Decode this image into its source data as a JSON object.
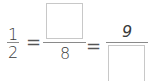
{
  "equation": {
    "fraction_1": {
      "numerator": "1",
      "denominator": "2"
    },
    "equals_1": "=",
    "fraction_2": {
      "numerator": "",
      "denominator": "8"
    },
    "equals_2": "=",
    "fraction_3": {
      "numerator": "9",
      "denominator": ""
    }
  },
  "colors": {
    "text": "#3a3a3a",
    "box_border": "#c8c8c8",
    "fraction_line": "#8a8a8a"
  }
}
